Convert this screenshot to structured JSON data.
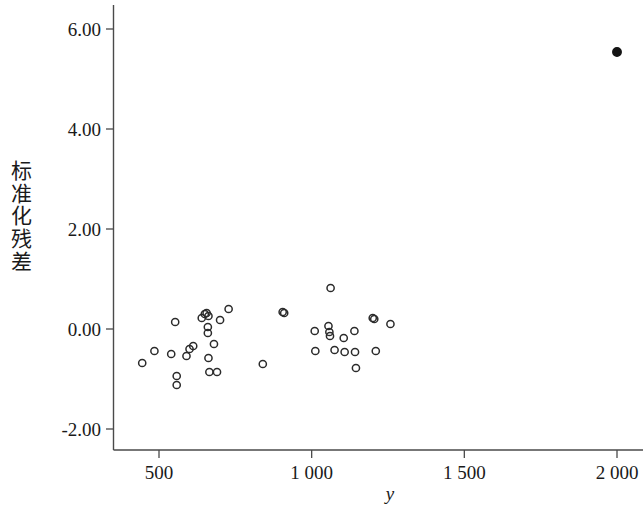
{
  "chart_data": {
    "type": "scatter",
    "title": "",
    "xlabel": "y",
    "ylabel": "标准化残差",
    "xlim": [
      310,
      2120
    ],
    "ylim": [
      -2.45,
      6.45
    ],
    "grid": false,
    "legend": "none",
    "x_ticks": [
      500,
      1000,
      1500,
      2000
    ],
    "x_tick_labels": [
      "500",
      "1 000",
      "1 500",
      "2 000"
    ],
    "y_ticks": [
      -2,
      0,
      2,
      4,
      6
    ],
    "y_tick_labels": [
      "-2.00",
      "0.00",
      "2.00",
      "4.00",
      "6.00"
    ],
    "y_tick_labels_shown": [
      "6.00",
      "4.00",
      "2.00",
      "0.00",
      "-2.00"
    ],
    "series": [
      {
        "name": "standardized residuals",
        "marker": "open-circle",
        "points": [
          {
            "x": 445,
            "y": -0.68
          },
          {
            "x": 485,
            "y": -0.44
          },
          {
            "x": 540,
            "y": -0.5
          },
          {
            "x": 553,
            "y": 0.14
          },
          {
            "x": 558,
            "y": -0.94
          },
          {
            "x": 558,
            "y": -1.12
          },
          {
            "x": 590,
            "y": -0.54
          },
          {
            "x": 600,
            "y": -0.4
          },
          {
            "x": 612,
            "y": -0.34
          },
          {
            "x": 640,
            "y": 0.22
          },
          {
            "x": 650,
            "y": 0.3
          },
          {
            "x": 656,
            "y": 0.32
          },
          {
            "x": 662,
            "y": 0.26
          },
          {
            "x": 660,
            "y": 0.04
          },
          {
            "x": 660,
            "y": -0.08
          },
          {
            "x": 662,
            "y": -0.58
          },
          {
            "x": 665,
            "y": -0.86
          },
          {
            "x": 680,
            "y": -0.3
          },
          {
            "x": 690,
            "y": -0.86
          },
          {
            "x": 700,
            "y": 0.18
          },
          {
            "x": 728,
            "y": 0.4
          },
          {
            "x": 840,
            "y": -0.7
          },
          {
            "x": 905,
            "y": 0.34
          },
          {
            "x": 910,
            "y": 0.32
          },
          {
            "x": 1010,
            "y": -0.04
          },
          {
            "x": 1012,
            "y": -0.44
          },
          {
            "x": 1055,
            "y": 0.06
          },
          {
            "x": 1058,
            "y": -0.06
          },
          {
            "x": 1060,
            "y": -0.14
          },
          {
            "x": 1062,
            "y": 0.82
          },
          {
            "x": 1075,
            "y": -0.42
          },
          {
            "x": 1105,
            "y": -0.18
          },
          {
            "x": 1108,
            "y": -0.46
          },
          {
            "x": 1140,
            "y": -0.04
          },
          {
            "x": 1142,
            "y": -0.46
          },
          {
            "x": 1145,
            "y": -0.78
          },
          {
            "x": 1200,
            "y": 0.22
          },
          {
            "x": 1205,
            "y": 0.2
          },
          {
            "x": 1210,
            "y": -0.44
          },
          {
            "x": 1258,
            "y": 0.1
          }
        ]
      },
      {
        "name": "outlier",
        "marker": "filled-circle",
        "points": [
          {
            "x": 2000,
            "y": 5.54
          }
        ]
      }
    ]
  }
}
